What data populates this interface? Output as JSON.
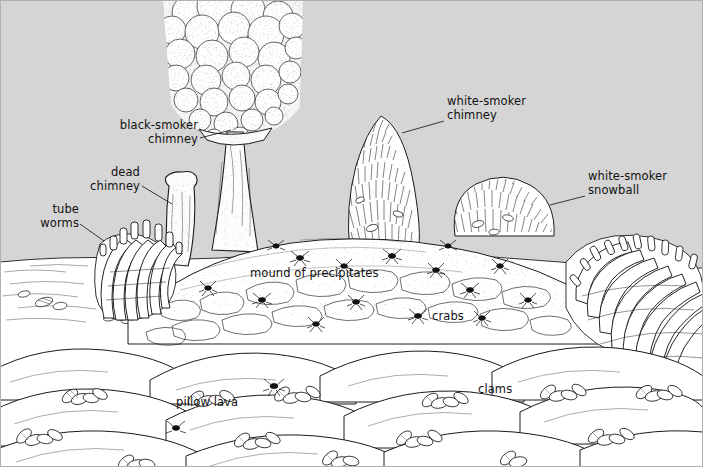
{
  "figure": {
    "domain": "Diagram",
    "width": 703,
    "height": 467,
    "style": "black-and-white pen-and-ink scientific line illustration",
    "background_color": "#d6d6d6",
    "seafloor_color": "#ffffff",
    "ink_color": "#1a1a1a"
  },
  "labels": [
    {
      "id": "black-smoker-chimney",
      "text": "black-smoker\nchimney",
      "align": "right",
      "x": 96,
      "y": 119,
      "width": 102,
      "leader": {
        "x1": 200,
        "y1": 138,
        "x2": 231,
        "y2": 130
      }
    },
    {
      "id": "dead-chimney",
      "text": "dead\nchimney",
      "align": "right",
      "x": 78,
      "y": 166,
      "width": 62,
      "leader": {
        "x1": 142,
        "y1": 186,
        "x2": 172,
        "y2": 204
      }
    },
    {
      "id": "tube-worms",
      "text": "tube\nworms",
      "align": "right",
      "x": 30,
      "y": 203,
      "width": 49,
      "leader": {
        "x1": 80,
        "y1": 224,
        "x2": 104,
        "y2": 241
      }
    },
    {
      "id": "white-smoker-chimney",
      "text": "white-smoker\nchimney",
      "align": "left",
      "x": 447,
      "y": 95,
      "width": 96,
      "leader": {
        "x1": 444,
        "y1": 121,
        "x2": 402,
        "y2": 133
      }
    },
    {
      "id": "white-smoker-snowball",
      "text": "white-smoker\nsnowball",
      "align": "left",
      "x": 588,
      "y": 170,
      "width": 96,
      "leader": {
        "x1": 585,
        "y1": 196,
        "x2": 550,
        "y2": 205
      }
    },
    {
      "id": "mound-of-precipitates",
      "text": "mound of precipitates",
      "align": "left",
      "x": 250,
      "y": 267,
      "width": 130,
      "leader": null
    },
    {
      "id": "crabs",
      "text": "crabs",
      "align": "left",
      "x": 432,
      "y": 310,
      "width": 38,
      "leader": null
    },
    {
      "id": "pillow-lava",
      "text": "pillow lava",
      "align": "left",
      "x": 176,
      "y": 396,
      "width": 62,
      "leader": null
    },
    {
      "id": "clams",
      "text": "clams",
      "align": "left",
      "x": 478,
      "y": 383,
      "width": 40,
      "leader": null
    }
  ],
  "features": [
    {
      "id": "black-smoker-chimney",
      "description": "tall central chimney with billowing dark plume"
    },
    {
      "id": "dead-chimney",
      "description": "short inactive stub chimney at left"
    },
    {
      "id": "tube-worms",
      "description": "clusters of vestimentiferan tube worms"
    },
    {
      "id": "white-smoker-chimney",
      "description": "bristly conical spire right of centre"
    },
    {
      "id": "white-smoker-snowball",
      "description": "rounded bushy precipitate mound"
    },
    {
      "id": "mound-of-precipitates",
      "description": "rubbly sulphide talus mound"
    },
    {
      "id": "crabs",
      "description": "small crabs scattered over the mound"
    },
    {
      "id": "pillow-lava",
      "description": "rounded pillow basalt flows in foreground"
    },
    {
      "id": "clams",
      "description": "vesicomyid clams in lava crevices"
    }
  ]
}
